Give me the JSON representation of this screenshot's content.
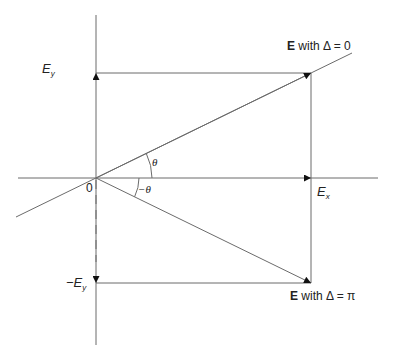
{
  "diagram": {
    "origin_label": "0",
    "labels": {
      "ey_base": "E",
      "ey_sub": "y",
      "neg_ey_prefix": "−E",
      "neg_ey_sub": "y",
      "ex_base": "E",
      "ex_sub": "x",
      "theta": "θ",
      "neg_theta": "−θ",
      "e_delta0_bold": "E",
      "e_delta0_rest": " with Δ = 0",
      "e_deltapi_bold": "E",
      "e_deltapi_rest": " with Δ = π"
    },
    "colors": {
      "line": "#6b6b6b",
      "arrow": "#111111",
      "text": "#222222"
    },
    "geometry": {
      "origin": [
        96,
        178
      ],
      "ex_point": [
        311,
        178
      ],
      "ey_point": [
        96,
        73
      ],
      "neg_ey_point": [
        96,
        283
      ],
      "e_delta0_tip": [
        311,
        73
      ],
      "e_deltapi_tip": [
        311,
        283
      ]
    }
  }
}
